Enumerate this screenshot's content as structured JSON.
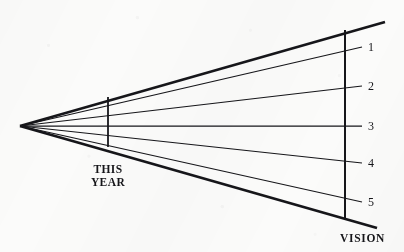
{
  "figure": {
    "background_color": "#fbfbfa",
    "ink_color": "#16161a"
  },
  "labels": {
    "this_year": "THIS\nYEAR",
    "vision": "VISION"
  },
  "axis": {
    "name": "vision-axis",
    "orientation": "vertical",
    "x": 345,
    "y_top": 30,
    "y_bottom": 220
  },
  "marker": {
    "name": "this-year-marker",
    "orientation": "vertical",
    "x": 108,
    "y_top": 97,
    "y_bottom": 147
  },
  "chart_data": {
    "type": "line",
    "xlabel": "",
    "ylabel": "",
    "grid": false,
    "legend": null,
    "origin": {
      "x": 20,
      "y": 126
    },
    "boundaries": [
      {
        "name": "upper-boundary",
        "x_end": 385,
        "y_end": 22,
        "weight": "thick"
      },
      {
        "name": "lower-boundary",
        "x_end": 377,
        "y_end": 228,
        "weight": "thick"
      }
    ],
    "series": [
      {
        "name": "1",
        "label": "1",
        "x_end": 362,
        "y_end": 47,
        "weight": "thin",
        "label_x": 368,
        "label_y": 40
      },
      {
        "name": "2",
        "label": "2",
        "x_end": 362,
        "y_end": 86,
        "weight": "thin",
        "label_x": 368,
        "label_y": 79
      },
      {
        "name": "3",
        "label": "3",
        "x_end": 362,
        "y_end": 126,
        "weight": "thin",
        "label_x": 368,
        "label_y": 119
      },
      {
        "name": "4",
        "label": "4",
        "x_end": 362,
        "y_end": 163,
        "weight": "thin",
        "label_x": 368,
        "label_y": 156
      },
      {
        "name": "5",
        "label": "5",
        "x_end": 362,
        "y_end": 202,
        "weight": "thin",
        "label_x": 368,
        "label_y": 195
      }
    ],
    "tick_labels": [
      "1",
      "2",
      "3",
      "4",
      "5"
    ],
    "annotations": [
      "THIS YEAR",
      "VISION"
    ]
  }
}
